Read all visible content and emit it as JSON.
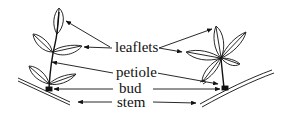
{
  "diagram": {
    "labels": {
      "leaflets": "leaflets",
      "petiole": "petiole",
      "bud": "bud",
      "stem": "stem"
    },
    "figures": [
      {
        "name": "pinnate-compound-leaf",
        "position": "left"
      },
      {
        "name": "palmate-compound-leaf",
        "position": "right"
      }
    ],
    "colors": {
      "ink": "#111111",
      "background": "#ffffff"
    }
  }
}
